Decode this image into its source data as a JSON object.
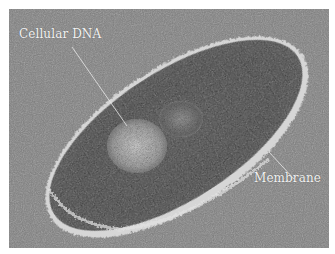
{
  "figure": {
    "labels": [
      {
        "id": "dna",
        "text": "Cellular DNA"
      },
      {
        "id": "membrane",
        "text": "Membrane"
      }
    ],
    "colors": {
      "background": "#7c7c7c",
      "cell_body": "#2e2e2e",
      "membrane_edge": "#d8d8d8",
      "dna_region": "#bdbdbd",
      "label_text": "#f2f2f2",
      "page_border": "#ffffff"
    }
  }
}
